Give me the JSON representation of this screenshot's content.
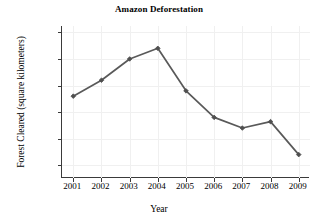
{
  "chart_data": {
    "type": "line",
    "title": "Amazon Deforestation",
    "xlabel": "Year",
    "ylabel": "Forest Cleared (square kilometers)",
    "categories": [
      "2001",
      "2002",
      "2003",
      "2004",
      "2005",
      "2006",
      "2007",
      "2008",
      "2009"
    ],
    "x": [
      2001,
      2002,
      2003,
      2004,
      2005,
      2006,
      2007,
      2008,
      2009
    ],
    "values": [
      18000,
      21000,
      25000,
      27000,
      19000,
      14000,
      12000,
      13200,
      7000
    ],
    "series": [
      {
        "name": "Forest Cleared",
        "values": [
          18000,
          21000,
          25000,
          27000,
          19000,
          14000,
          12000,
          13200,
          7000
        ]
      }
    ],
    "xlim": [
      2000.6,
      2009.4
    ],
    "ylim": [
      2600,
      31200
    ],
    "yticks": [
      5000,
      10000,
      15000,
      20000,
      25000,
      30000
    ],
    "ytick_labels": [
      "5000",
      "10,000",
      "15,000",
      "20,000",
      "25,000",
      "30,000"
    ],
    "xticks": [
      2001,
      2002,
      2003,
      2004,
      2005,
      2006,
      2007,
      2008,
      2009
    ],
    "xtick_labels": [
      "2001",
      "2002",
      "2003",
      "2004",
      "2005",
      "2006",
      "2007",
      "2008",
      "2009"
    ],
    "grid": true,
    "legend": null,
    "legend_position": "none",
    "line_color": "#595959",
    "marker_color": "#4f4f4f",
    "marker": "diamond",
    "grid_color": "#f0f0f0",
    "axis_color": "#3a3a3a",
    "background": "#ffffff"
  }
}
